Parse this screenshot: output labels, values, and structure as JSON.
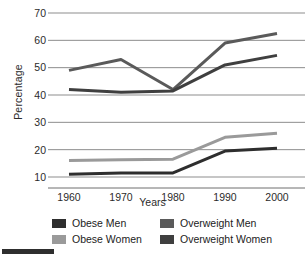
{
  "chart_data": {
    "type": "line",
    "title": "",
    "xlabel": "Years",
    "ylabel": "Percentage",
    "categories": [
      "1960",
      "1970",
      "1980",
      "1990",
      "2000"
    ],
    "x": [
      1960,
      1970,
      1980,
      1990,
      2000
    ],
    "ylim": [
      5,
      70
    ],
    "xlim": [
      1955,
      2004
    ],
    "yticks": [
      70,
      60,
      50,
      40,
      30,
      20,
      10
    ],
    "grid": true,
    "legend_position": "bottom",
    "series": [
      {
        "name": "Obese Men",
        "color": "#2e2e2e",
        "values": [
          11,
          11.5,
          11.5,
          19.5,
          20.5
        ]
      },
      {
        "name": "Obese Women",
        "color": "#9a9a9a",
        "values": [
          16,
          16.3,
          16.5,
          24.5,
          26
        ]
      },
      {
        "name": "Overweight Men",
        "color": "#5a5a5a",
        "values": [
          49,
          53,
          42,
          59,
          62.5
        ]
      },
      {
        "name": "Overweight Women",
        "color": "#3f3f3f",
        "values": [
          42,
          41,
          41.5,
          51,
          54.5
        ]
      }
    ]
  },
  "axis": {
    "y_label": "Percentage",
    "x_label": "Years",
    "y_ticks": [
      "70",
      "60",
      "50",
      "40",
      "30",
      "20",
      "10"
    ],
    "x_ticks": [
      "1960",
      "1970",
      "1980",
      "1990",
      "2000"
    ]
  },
  "legend": {
    "items": [
      {
        "label": "Obese Men",
        "color": "#2e2e2e"
      },
      {
        "label": "Overweight Men",
        "color": "#5a5a5a"
      },
      {
        "label": "Obese Women",
        "color": "#9a9a9a"
      },
      {
        "label": "Overweight Women",
        "color": "#3f3f3f"
      }
    ]
  },
  "style": {
    "grid_color": "#8d8d8d",
    "text_color": "#2b2b2b",
    "background": "#ffffff"
  }
}
